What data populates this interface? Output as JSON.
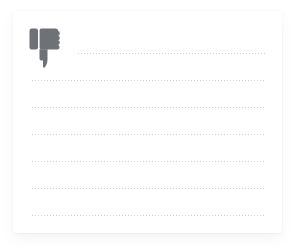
{
  "page": {
    "background_color": "#ffffff",
    "width": 298,
    "height": 251
  },
  "card": {
    "name": "note-card",
    "background_color": "#ffffff",
    "left": 13,
    "top": 11,
    "width": 269,
    "height": 222
  },
  "icon": {
    "name": "thumbs-down-icon",
    "semantic": "thumbs-down",
    "label": "Dislike",
    "color": "#6e7175",
    "left": 16,
    "top": 16,
    "width": 34,
    "height": 42
  },
  "ruled_lines": {
    "color": "#c9cdd4",
    "style": "dotted",
    "count": 8,
    "right_edge": 252,
    "items": [
      {
        "id": "line-1",
        "left": 65,
        "top": 41,
        "width": 187,
        "indented": true
      },
      {
        "id": "line-2",
        "left": 19,
        "top": 68,
        "width": 233,
        "indented": false
      },
      {
        "id": "line-3",
        "left": 19,
        "top": 95,
        "width": 233,
        "indented": false
      },
      {
        "id": "line-4",
        "left": 19,
        "top": 122,
        "width": 233,
        "indented": false
      },
      {
        "id": "line-5",
        "left": 19,
        "top": 149,
        "width": 233,
        "indented": false
      },
      {
        "id": "line-6",
        "left": 19,
        "top": 176,
        "width": 233,
        "indented": false
      },
      {
        "id": "line-7",
        "left": 19,
        "top": 203,
        "width": 233,
        "indented": false
      }
    ]
  },
  "extra_lines": [
    {
      "id": "line-8",
      "left": 19,
      "top": 203,
      "width": 233
    }
  ]
}
